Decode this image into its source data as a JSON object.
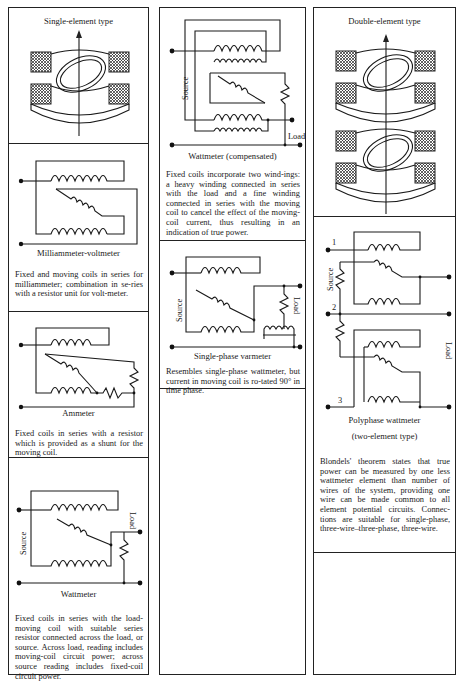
{
  "columns": [
    {
      "panels": [
        {
          "title": "Single-element type",
          "figure": "single-element-movement"
        },
        {
          "caption": "Milliammeter-voltmeter",
          "description": "Fixed and moving coils in series for milliammeter; combination in se-ries with a resistor unit for volt-meter."
        },
        {
          "caption": "Ammeter",
          "description": "Fixed coils in series with a resistor which is provided as a shunt for the moving coil."
        },
        {
          "caption": "Wattmeter",
          "labels": {
            "source": "Source",
            "load": "Load"
          },
          "description": "Fixed coils in series with the load-moving coil with suitable series resistor connected across the load, or source. Across load, reading includes moving-coil circuit power; across source reading includes fixed-coil circuit power."
        }
      ]
    },
    {
      "panels": [
        {
          "caption": "Wattmeter (compensated)",
          "labels": {
            "source": "Source",
            "load": "Load"
          },
          "description": "Fixed coils incorporate two wind-ings: a heavy winding connected in series with the load and a fine winding connected in series with the moving coil to cancel the effect of the moving-coil current, thus resulting in an indication of true power."
        },
        {
          "caption": "Single-phase varmeter",
          "labels": {
            "source": "Source",
            "load": "Load"
          },
          "description": "Resembles single-phase wattmeter, but current in moving coil is ro-tated 90° in time phase."
        },
        {
          "empty": true
        }
      ]
    },
    {
      "panels": [
        {
          "title": "Double-element type",
          "figure": "double-element-movement"
        },
        {
          "caption": "Polyphase wattmeter",
          "subcaption": "(two-element type)",
          "labels": {
            "source": "Source",
            "load": "Load",
            "wire1": "1",
            "wire2": "2",
            "wire3": "3"
          },
          "description": "Blondels' theorem states that true power can be measured by one less wattmeter element than number of wires of the system, providing one wire can be made common to all element potential circuits. Connec-tions are suitable for single-phase, three-wire–three-phase, three-wire."
        },
        {
          "empty": true
        }
      ]
    }
  ]
}
